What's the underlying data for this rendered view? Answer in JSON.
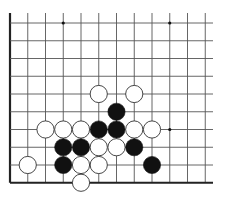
{
  "board": {
    "colors": {
      "background": "#ffffff",
      "grid_line": "#555555",
      "edge_line": "#222222",
      "black_stone": "#111111",
      "white_stone_fill": "#ffffff",
      "white_stone_stroke": "#333333",
      "star_point": "#111111"
    },
    "geometry": {
      "origin_x": 10,
      "origin_y": 23,
      "spacing": 17.75,
      "columns": 12,
      "rows": 10,
      "top_extend_y": 13,
      "right_extend_x": 213,
      "stone_radius": 8.6,
      "edges": [
        "left",
        "bottom"
      ]
    },
    "star_points": [
      {
        "col": 3,
        "row": 0
      },
      {
        "col": 9,
        "row": 0
      },
      {
        "col": 9,
        "row": 6
      }
    ],
    "stones": [
      {
        "color": "white",
        "col": 5,
        "row": 4
      },
      {
        "color": "white",
        "col": 7,
        "row": 4
      },
      {
        "color": "black",
        "col": 6,
        "row": 5
      },
      {
        "color": "white",
        "col": 2,
        "row": 6
      },
      {
        "color": "white",
        "col": 3,
        "row": 6
      },
      {
        "color": "white",
        "col": 4,
        "row": 6
      },
      {
        "color": "black",
        "col": 5,
        "row": 6
      },
      {
        "color": "black",
        "col": 6,
        "row": 6
      },
      {
        "color": "white",
        "col": 7,
        "row": 6
      },
      {
        "color": "white",
        "col": 8,
        "row": 6
      },
      {
        "color": "black",
        "col": 3,
        "row": 7
      },
      {
        "color": "black",
        "col": 4,
        "row": 7
      },
      {
        "color": "white",
        "col": 5,
        "row": 7
      },
      {
        "color": "white",
        "col": 6,
        "row": 7
      },
      {
        "color": "black",
        "col": 7,
        "row": 7
      },
      {
        "color": "white",
        "col": 1,
        "row": 8
      },
      {
        "color": "black",
        "col": 3,
        "row": 8
      },
      {
        "color": "white",
        "col": 4,
        "row": 8
      },
      {
        "color": "white",
        "col": 5,
        "row": 8
      },
      {
        "color": "black",
        "col": 8,
        "row": 8
      },
      {
        "color": "white",
        "col": 4,
        "row": 9
      }
    ]
  }
}
